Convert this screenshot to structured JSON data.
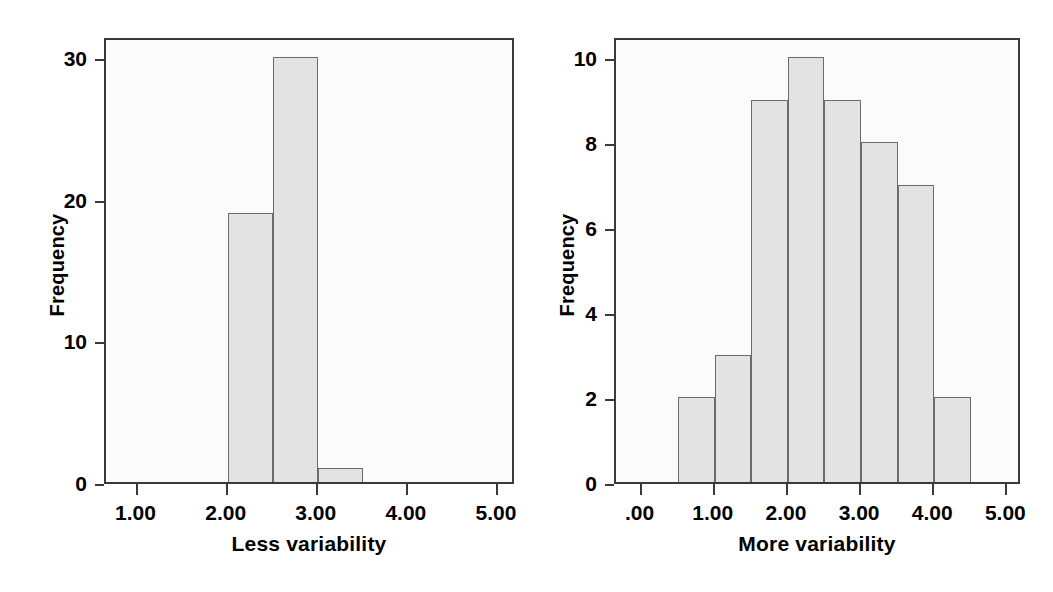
{
  "figure": {
    "background_color": "#ffffff",
    "bar_fill_color": "#e3e3e3",
    "bar_border_color": "#6b6b6b",
    "axis_color": "#3a3a3a",
    "plot_background_color": "#fbfbfb"
  },
  "panels": {
    "left": {
      "ylabel": "Frequency",
      "xlabel": "Less variability",
      "ytick_labels": [
        "30",
        "20",
        "10",
        "0"
      ],
      "xtick_labels": [
        "1.00",
        "2.00",
        "3.00",
        "4.00",
        "5.00"
      ]
    },
    "right": {
      "ylabel": "Frequency",
      "xlabel": "More variability",
      "ytick_labels": [
        "10",
        "8",
        "6",
        "4",
        "2",
        "0"
      ],
      "xtick_labels": [
        ".00",
        "1.00",
        "2.00",
        "3.00",
        "4.00",
        "5.00"
      ]
    }
  },
  "chart_data": [
    {
      "type": "bar",
      "title": "",
      "subtitle": "",
      "xlabel": "Less variability",
      "ylabel": "Frequency",
      "grid": false,
      "legend": null,
      "xlim": [
        0.65,
        5.2
      ],
      "ylim": [
        0,
        31.5
      ],
      "yticks": [
        0,
        10,
        20,
        30
      ],
      "ytick_labels": [
        "0",
        "10",
        "20",
        "30"
      ],
      "xticks": [
        1.0,
        2.0,
        3.0,
        4.0,
        5.0
      ],
      "xtick_labels": [
        "1.00",
        "2.00",
        "3.00",
        "4.00",
        "5.00"
      ],
      "bin_width": 0.5,
      "bins": [
        {
          "left": 2.0,
          "right": 2.5,
          "count": 19
        },
        {
          "left": 2.5,
          "right": 3.0,
          "count": 30
        },
        {
          "left": 3.0,
          "right": 3.5,
          "count": 1
        }
      ],
      "categories": [
        "2.00-2.50",
        "2.50-3.00",
        "3.00-3.50"
      ],
      "values": [
        19,
        30,
        1
      ]
    },
    {
      "type": "bar",
      "title": "",
      "subtitle": "",
      "xlabel": "More variability",
      "ylabel": "Frequency",
      "grid": false,
      "legend": null,
      "xlim": [
        -0.35,
        5.2
      ],
      "ylim": [
        0,
        10.5
      ],
      "yticks": [
        0,
        2,
        4,
        6,
        8,
        10
      ],
      "ytick_labels": [
        "0",
        "2",
        "4",
        "6",
        "8",
        "10"
      ],
      "xticks": [
        0.0,
        1.0,
        2.0,
        3.0,
        4.0,
        5.0
      ],
      "xtick_labels": [
        ".00",
        "1.00",
        "2.00",
        "3.00",
        "4.00",
        "5.00"
      ],
      "bin_width": 0.5,
      "bins": [
        {
          "left": 0.5,
          "right": 1.0,
          "count": 2
        },
        {
          "left": 1.0,
          "right": 1.5,
          "count": 3
        },
        {
          "left": 1.5,
          "right": 2.0,
          "count": 9
        },
        {
          "left": 2.0,
          "right": 2.5,
          "count": 10
        },
        {
          "left": 2.5,
          "right": 3.0,
          "count": 9
        },
        {
          "left": 3.0,
          "right": 3.5,
          "count": 8
        },
        {
          "left": 3.5,
          "right": 4.0,
          "count": 7
        },
        {
          "left": 4.0,
          "right": 4.5,
          "count": 2
        }
      ],
      "categories": [
        "0.50-1.00",
        "1.00-1.50",
        "1.50-2.00",
        "2.00-2.50",
        "2.50-3.00",
        "3.00-3.50",
        "3.50-4.00",
        "4.00-4.50"
      ],
      "values": [
        2,
        3,
        9,
        10,
        9,
        8,
        7,
        2
      ]
    }
  ]
}
